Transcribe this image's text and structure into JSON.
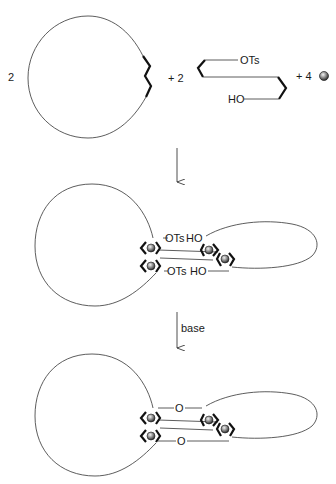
{
  "scheme": {
    "reactants": {
      "macrocycle_coefficient": "2",
      "linker_coefficient": "+ 2",
      "linker_top_group": "OTs",
      "linker_bottom_group": "HO",
      "template_coefficient": "+ 4",
      "template_icon": "metal-ball-icon"
    },
    "step1": {
      "arrow_label": "",
      "intermediate_labels": {
        "top_left": "OTs",
        "top_right": "HO",
        "bottom_left": "OTs",
        "bottom_right": "HO"
      }
    },
    "step2": {
      "arrow_label": "base",
      "product_labels": {
        "top_bridge": "O",
        "bottom_bridge": "O"
      }
    }
  }
}
